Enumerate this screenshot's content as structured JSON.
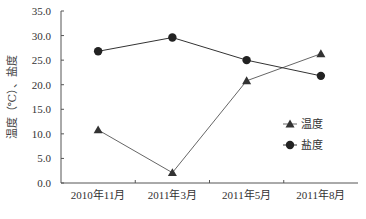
{
  "chart_data": {
    "type": "line",
    "title": "",
    "xlabel": "",
    "ylabel": "温度（℃）、盐度",
    "categories": [
      "2010年11月",
      "2011年3月",
      "2011年5月",
      "2011年8月"
    ],
    "series": [
      {
        "name": "温度",
        "marker": "triangle",
        "color": "#333333",
        "line_color": "#666666",
        "values": [
          10.8,
          2.1,
          20.8,
          26.3
        ]
      },
      {
        "name": "盐度",
        "marker": "circle",
        "color": "#222222",
        "line_color": "#333333",
        "values": [
          26.8,
          29.6,
          25.0,
          21.8
        ]
      }
    ],
    "ylim": [
      0,
      35
    ],
    "yticks": [
      "0.0",
      "5.0",
      "10.0",
      "15.0",
      "20.0",
      "25.0",
      "30.0",
      "35.0"
    ],
    "grid": false,
    "legend_position": "right-inside"
  },
  "layout": {
    "plot": {
      "x0": 61,
      "y0": 183,
      "x1": 358,
      "y1": 11
    },
    "legend": {
      "x": 283,
      "y": 124,
      "row_gap": 21
    }
  }
}
